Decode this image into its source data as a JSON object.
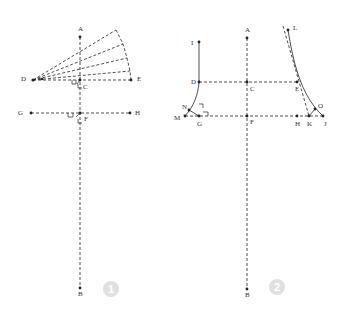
{
  "figures": [
    {
      "badge": "1",
      "labels": {
        "A": "A",
        "B": "B",
        "C": "C",
        "D": "D",
        "E": "E",
        "F": "F",
        "G": "G",
        "H": "H"
      }
    },
    {
      "badge": "2",
      "labels": {
        "A": "A",
        "B": "B",
        "C": "C",
        "D": "D",
        "E": "E",
        "F": "F",
        "G": "G",
        "H": "H",
        "I": "I",
        "J": "J",
        "K": "K",
        "L": "L",
        "M": "M",
        "N": "N",
        "O": "O"
      }
    }
  ],
  "colors": {
    "line": "#222222",
    "badge": "#e0e0e0"
  }
}
